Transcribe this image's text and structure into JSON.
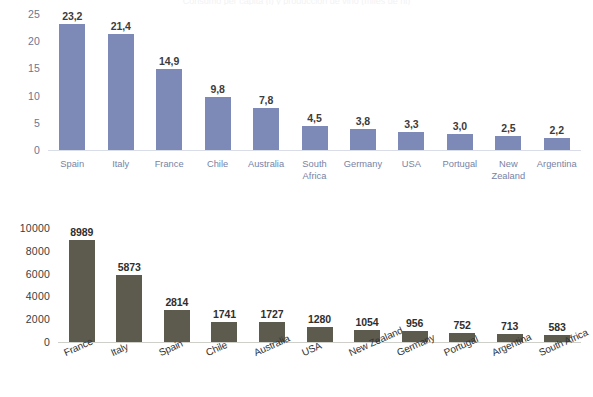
{
  "page": {
    "title_faint": "Consumo per capita (l) y produccion de vino (miles de hl)"
  },
  "chart_data": [
    {
      "id": "top",
      "type": "bar",
      "title": "",
      "xlabel": "",
      "ylabel": "",
      "ylim": [
        0,
        25
      ],
      "yticks": [
        "0",
        "5",
        "10",
        "15",
        "20",
        "25"
      ],
      "grid": false,
      "decimal_separator": ",",
      "bar_color": "#7d8ab7",
      "label_color": "#7782a4",
      "categories": [
        "Spain",
        "Italy",
        "France",
        "Chile",
        "Australia",
        "South\nAfrica",
        "Germany",
        "USA",
        "Portugal",
        "New\nZealand",
        "Argentina"
      ],
      "values": [
        23.2,
        21.4,
        14.9,
        9.8,
        7.8,
        4.5,
        3.8,
        3.3,
        3.0,
        2.5,
        2.2
      ],
      "value_labels": [
        "23,2",
        "21,4",
        "14,9",
        "9,8",
        "7,8",
        "4,5",
        "3,8",
        "3,3",
        "3,0",
        "2,5",
        "2,2"
      ]
    },
    {
      "id": "bottom",
      "type": "bar",
      "title": "",
      "xlabel": "",
      "ylabel": "",
      "ylim": [
        0,
        10000
      ],
      "yticks": [
        "0",
        "2000",
        "4000",
        "6000",
        "8000",
        "10000"
      ],
      "grid": false,
      "bar_color": "#5c5b4d",
      "label_color": "#333333",
      "label_rotation": -24,
      "categories": [
        "France",
        "Italy",
        "Spain",
        "Chile",
        "Australia",
        "USA",
        "New Zealand",
        "Germany",
        "Portugal",
        "Argentina",
        "South Africa"
      ],
      "values": [
        8989,
        5873,
        2814,
        1741,
        1727,
        1280,
        1054,
        956,
        752,
        713,
        583
      ],
      "value_labels": [
        "8989",
        "5873",
        "2814",
        "1741",
        "1727",
        "1280",
        "1054",
        "956",
        "752",
        "713",
        "583"
      ]
    }
  ]
}
